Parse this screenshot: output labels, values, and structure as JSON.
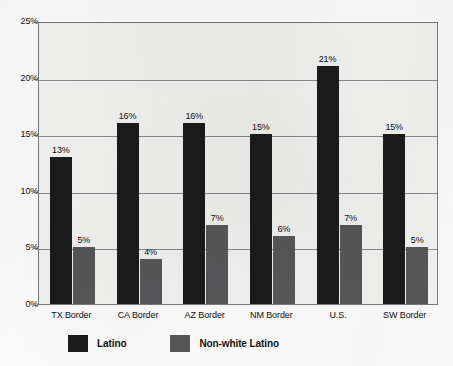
{
  "chart_data": {
    "type": "bar",
    "title": "",
    "xlabel": "",
    "ylabel": "",
    "ylim": [
      0,
      25
    ],
    "grid": true,
    "legend_position": "bottom-left",
    "categories": [
      "TX Border",
      "CA Border",
      "AZ Border",
      "NM Border",
      "U.S.",
      "SW Border"
    ],
    "ytick_labels": [
      "0%",
      "5%",
      "10%",
      "15%",
      "20%",
      "25%"
    ],
    "ytick_values": [
      0,
      5,
      10,
      15,
      20,
      25
    ],
    "series": [
      {
        "name": "Latino",
        "color": "#1b1b1b",
        "values": [
          13,
          16,
          16,
          15,
          21,
          15
        ],
        "labels": [
          "13%",
          "16%",
          "16%",
          "15%",
          "21%",
          "15%"
        ]
      },
      {
        "name": "Non-white Latino",
        "color": "#58585a",
        "values": [
          5,
          4,
          7,
          6,
          7,
          5
        ],
        "labels": [
          "5%",
          "4%",
          "7%",
          "6%",
          "7%",
          "5%"
        ]
      }
    ]
  },
  "legend": {
    "items": [
      {
        "label": "Latino",
        "swatch": "black-swatch-icon"
      },
      {
        "label": "Non-white Latino",
        "swatch": "gray-swatch-icon"
      }
    ]
  }
}
